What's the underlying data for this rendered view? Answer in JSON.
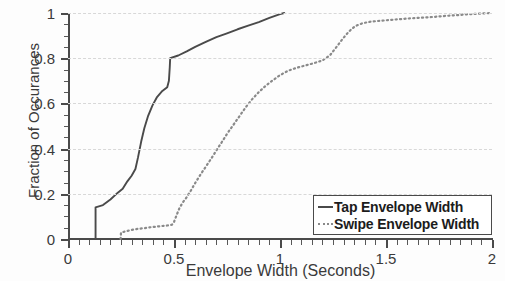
{
  "chart_data": {
    "type": "line",
    "title": "",
    "xlabel": "Envelope Width (Seconds)",
    "ylabel": "Fraction of Occurances",
    "xlim": [
      0,
      2
    ],
    "ylim": [
      0,
      1
    ],
    "grid": true,
    "legend_position": "bottom-right",
    "x_ticks": [
      0,
      0.5,
      1,
      1.5,
      2
    ],
    "x_tick_labels": [
      "0",
      "0.5",
      "1",
      "1.5",
      "2"
    ],
    "x_minor_tick_step": 0.05,
    "y_ticks": [
      0,
      0.2,
      0.4,
      0.6,
      0.8,
      1
    ],
    "y_tick_labels": [
      "0",
      "0.2",
      "0.4",
      "0.6",
      "0.8",
      "1"
    ],
    "y_minor_tick_step": 0.05,
    "series": [
      {
        "name": "Tap Envelope Width",
        "style": "solid",
        "color": "#4a4a4a",
        "points": [
          [
            0.13,
            0.0
          ],
          [
            0.13,
            0.14
          ],
          [
            0.165,
            0.15
          ],
          [
            0.2,
            0.175
          ],
          [
            0.235,
            0.205
          ],
          [
            0.258,
            0.222
          ],
          [
            0.28,
            0.255
          ],
          [
            0.3,
            0.28
          ],
          [
            0.318,
            0.31
          ],
          [
            0.33,
            0.36
          ],
          [
            0.345,
            0.43
          ],
          [
            0.36,
            0.49
          ],
          [
            0.378,
            0.545
          ],
          [
            0.398,
            0.59
          ],
          [
            0.42,
            0.628
          ],
          [
            0.445,
            0.655
          ],
          [
            0.468,
            0.672
          ],
          [
            0.476,
            0.7
          ],
          [
            0.48,
            0.76
          ],
          [
            0.482,
            0.8
          ],
          [
            0.52,
            0.812
          ],
          [
            0.56,
            0.83
          ],
          [
            0.6,
            0.85
          ],
          [
            0.65,
            0.872
          ],
          [
            0.7,
            0.893
          ],
          [
            0.75,
            0.91
          ],
          [
            0.8,
            0.928
          ],
          [
            0.85,
            0.944
          ],
          [
            0.9,
            0.96
          ],
          [
            0.95,
            0.978
          ],
          [
            1.0,
            0.995
          ],
          [
            1.02,
            1.0
          ]
        ]
      },
      {
        "name": "Swipe Envelope Width",
        "style": "dotted",
        "color": "#8a8a8a",
        "points": [
          [
            0.248,
            0.0
          ],
          [
            0.25,
            0.028
          ],
          [
            0.275,
            0.035
          ],
          [
            0.3,
            0.04
          ],
          [
            0.33,
            0.045
          ],
          [
            0.36,
            0.048
          ],
          [
            0.39,
            0.052
          ],
          [
            0.42,
            0.055
          ],
          [
            0.45,
            0.058
          ],
          [
            0.47,
            0.06
          ],
          [
            0.49,
            0.063
          ],
          [
            0.5,
            0.075
          ],
          [
            0.512,
            0.105
          ],
          [
            0.525,
            0.135
          ],
          [
            0.54,
            0.16
          ],
          [
            0.56,
            0.185
          ],
          [
            0.58,
            0.215
          ],
          [
            0.6,
            0.248
          ],
          [
            0.625,
            0.285
          ],
          [
            0.65,
            0.32
          ],
          [
            0.675,
            0.355
          ],
          [
            0.7,
            0.392
          ],
          [
            0.725,
            0.428
          ],
          [
            0.75,
            0.465
          ],
          [
            0.78,
            0.505
          ],
          [
            0.81,
            0.545
          ],
          [
            0.84,
            0.585
          ],
          [
            0.87,
            0.62
          ],
          [
            0.9,
            0.65
          ],
          [
            0.935,
            0.68
          ],
          [
            0.97,
            0.705
          ],
          [
            1.0,
            0.725
          ],
          [
            1.04,
            0.745
          ],
          [
            1.08,
            0.758
          ],
          [
            1.12,
            0.768
          ],
          [
            1.16,
            0.778
          ],
          [
            1.2,
            0.79
          ],
          [
            1.235,
            0.812
          ],
          [
            1.265,
            0.848
          ],
          [
            1.295,
            0.885
          ],
          [
            1.325,
            0.918
          ],
          [
            1.355,
            0.942
          ],
          [
            1.39,
            0.955
          ],
          [
            1.43,
            0.962
          ],
          [
            1.48,
            0.966
          ],
          [
            1.53,
            0.97
          ],
          [
            1.58,
            0.974
          ],
          [
            1.63,
            0.977
          ],
          [
            1.68,
            0.98
          ],
          [
            1.73,
            0.983
          ],
          [
            1.78,
            0.987
          ],
          [
            1.83,
            0.99
          ],
          [
            1.88,
            0.994
          ],
          [
            1.94,
            0.997
          ],
          [
            2.0,
            1.0
          ]
        ]
      }
    ]
  },
  "legend": {
    "entries": [
      {
        "label": "Tap Envelope Width"
      },
      {
        "label": "Swipe Envelope Width"
      }
    ]
  }
}
